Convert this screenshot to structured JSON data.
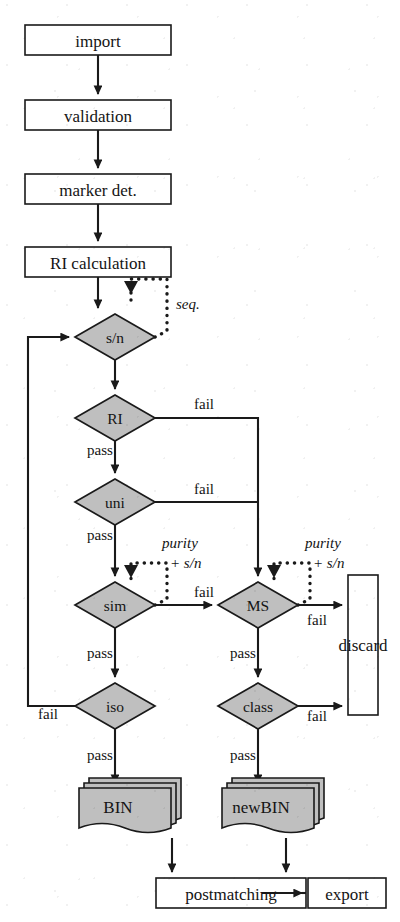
{
  "diagram": {
    "colors": {
      "node_fill_gray": "#bfbfbf",
      "node_fill_white": "#ffffff",
      "stroke": "#1a1a1a",
      "background": "#ffffff"
    },
    "process_nodes": [
      {
        "id": "import",
        "label": "import",
        "x": 98,
        "y": 40,
        "w": 146,
        "h": 30
      },
      {
        "id": "validation",
        "label": "validation",
        "x": 98,
        "y": 115,
        "w": 146,
        "h": 30
      },
      {
        "id": "marker-det",
        "label": "marker det.",
        "x": 98,
        "y": 189,
        "w": 146,
        "h": 30
      },
      {
        "id": "ri-calculation",
        "label": "RI calculation",
        "x": 98,
        "y": 262,
        "w": 146,
        "h": 30
      },
      {
        "id": "postmatching",
        "label": "postmatching",
        "x": 231,
        "y": 893,
        "w": 150,
        "h": 30
      },
      {
        "id": "export",
        "label": "export",
        "x": 347,
        "y": 893,
        "w": 78,
        "h": 30
      }
    ],
    "discard_node": {
      "id": "discard",
      "label": "discard",
      "x": 363,
      "y": 645,
      "w": 30,
      "h": 140
    },
    "decision_nodes": [
      {
        "id": "sn",
        "label": "s/n",
        "x": 115,
        "y": 337,
        "rx": 40,
        "ry": 23
      },
      {
        "id": "ri",
        "label": "RI",
        "x": 115,
        "y": 418,
        "rx": 40,
        "ry": 23
      },
      {
        "id": "uni",
        "label": "uni",
        "x": 115,
        "y": 502,
        "rx": 40,
        "ry": 23
      },
      {
        "id": "sim",
        "label": "sim",
        "x": 115,
        "y": 605,
        "rx": 40,
        "ry": 23
      },
      {
        "id": "iso",
        "label": "iso",
        "x": 115,
        "y": 706,
        "rx": 40,
        "ry": 23
      },
      {
        "id": "ms",
        "label": "MS",
        "x": 258,
        "y": 605,
        "rx": 40,
        "ry": 23
      },
      {
        "id": "class",
        "label": "class",
        "x": 258,
        "y": 706,
        "rx": 40,
        "ry": 23
      }
    ],
    "data_nodes": [
      {
        "id": "bin",
        "label": "BIN",
        "x": 115,
        "y": 808,
        "w": 92,
        "h": 44
      },
      {
        "id": "newbin",
        "label": "newBIN",
        "x": 258,
        "y": 808,
        "w": 92,
        "h": 44
      }
    ],
    "edge_labels": [
      {
        "id": "ri-fail",
        "text": "fail",
        "x": 204,
        "y": 404
      },
      {
        "id": "ri-pass",
        "text": "pass",
        "x": 100,
        "y": 450
      },
      {
        "id": "uni-fail",
        "text": "fail",
        "x": 204,
        "y": 489
      },
      {
        "id": "uni-pass",
        "text": "pass",
        "x": 100,
        "y": 535
      },
      {
        "id": "sim-fail",
        "text": "fail",
        "x": 204,
        "y": 592
      },
      {
        "id": "sim-pass",
        "text": "pass",
        "x": 100,
        "y": 653
      },
      {
        "id": "ms-fail",
        "text": "fail",
        "x": 317,
        "y": 620
      },
      {
        "id": "ms-pass",
        "text": "pass",
        "x": 243,
        "y": 653
      },
      {
        "id": "iso-fail",
        "text": "fail",
        "x": 48,
        "y": 714
      },
      {
        "id": "iso-pass",
        "text": "pass",
        "x": 100,
        "y": 755
      },
      {
        "id": "class-fail",
        "text": "fail",
        "x": 317,
        "y": 716
      },
      {
        "id": "class-pass",
        "text": "pass",
        "x": 243,
        "y": 755
      }
    ],
    "loop_notes": [
      {
        "id": "seq",
        "line1": "seq.",
        "line2": "",
        "x": 186,
        "y": 304
      },
      {
        "id": "sim-purity",
        "line1": "purity",
        "line2": "+ s/n",
        "x": 188,
        "y": 551
      },
      {
        "id": "ms-purity",
        "line1": "purity",
        "line2": "+ s/n",
        "x": 330,
        "y": 551
      }
    ]
  }
}
